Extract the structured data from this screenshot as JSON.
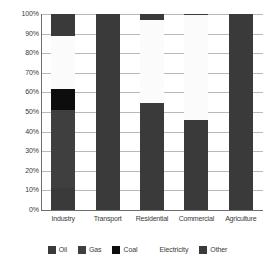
{
  "chart_data": {
    "type": "bar",
    "stacked": true,
    "stacked_mode": "percent",
    "title": "",
    "subtitle": "",
    "xlabel": "",
    "ylabel": "",
    "ylim": [
      0,
      100
    ],
    "ytick_labels": [
      "100%",
      "90%",
      "80%",
      "70%",
      "60%",
      "50%",
      "40%",
      "30%",
      "20%",
      "10%",
      "0%"
    ],
    "ytick_values": [
      100,
      90,
      80,
      70,
      60,
      50,
      40,
      30,
      20,
      10,
      0
    ],
    "grid": true,
    "legend_position": "bottom",
    "categories": [
      "Industry",
      "Transport",
      "Residential",
      "Commercial",
      "Agriculture"
    ],
    "series": [
      {
        "name": "Oil",
        "color": "#3a3a3a",
        "values": [
          11,
          100,
          54.5,
          46,
          97
        ]
      },
      {
        "name": "Gas",
        "color": "#3f3f3f",
        "values": [
          40,
          0,
          0,
          0,
          0
        ]
      },
      {
        "name": "Coal",
        "color": "#0d0d0d",
        "values": [
          11,
          0,
          0,
          0,
          0
        ]
      },
      {
        "name": "Electricity",
        "color": "#fbfbfb",
        "values": [
          27,
          0,
          42.5,
          53.5,
          0
        ]
      },
      {
        "name": "Other",
        "color": "#3a3a3a",
        "values": [
          11,
          0,
          3,
          0.5,
          3
        ]
      }
    ]
  },
  "legend": {
    "items": [
      {
        "label": "Oil",
        "color": "#3a3a3a"
      },
      {
        "label": "Gas",
        "color": "#3f3f3f"
      },
      {
        "label": "Coal",
        "color": "#0d0d0d"
      },
      {
        "label": "Electricity",
        "color": "#ffffff"
      },
      {
        "label": "Other",
        "color": "#3a3a3a"
      }
    ]
  },
  "axis": {
    "y_ticks": [
      "100%",
      "90%",
      "80%",
      "70%",
      "60%",
      "50%",
      "40%",
      "30%",
      "20%",
      "10%",
      "0%"
    ],
    "x_ticks": [
      "Industry",
      "Transport",
      "Residential",
      "Commercial",
      "Agriculture"
    ]
  },
  "colors": {
    "gridline": "#b9b9b9",
    "axis": "#6e6e6e",
    "text": "#3a3a3a",
    "background": "#ffffff"
  }
}
